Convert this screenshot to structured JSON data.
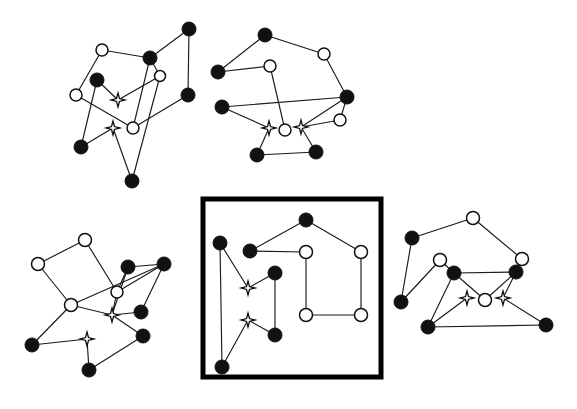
{
  "figure": {
    "background_color": "#ffffff",
    "edge_color": "#1a1a1a",
    "filled_node_color": "#111111",
    "hollow_node_fill": "#ffffff",
    "hollow_node_stroke": "#111111",
    "star_node_fill": "#ffffff",
    "star_node_stroke": "#111111",
    "panel_border_color": "#000000",
    "width": 577,
    "height": 409
  },
  "chart_data": {
    "type": "scatter",
    "xlabel": "",
    "ylabel": "",
    "grid": false,
    "legend": "none",
    "node_types": [
      "filled-circle",
      "hollow-circle",
      "four-point-star"
    ],
    "panels": [
      {
        "id": "panel-top-left",
        "label": "top-left graph",
        "boxed": false,
        "nodes": [
          {
            "id": "A0",
            "type": "hollow-circle",
            "x": 102,
            "y": 50,
            "r": 6
          },
          {
            "id": "A1",
            "type": "filled-circle",
            "x": 150,
            "y": 58,
            "r": 7
          },
          {
            "id": "A2",
            "type": "filled-circle",
            "x": 189,
            "y": 29,
            "r": 7
          },
          {
            "id": "A3",
            "type": "hollow-circle",
            "x": 160,
            "y": 76,
            "r": 5.5
          },
          {
            "id": "A4",
            "type": "filled-circle",
            "x": 97,
            "y": 80,
            "r": 7
          },
          {
            "id": "A5",
            "type": "hollow-circle",
            "x": 76,
            "y": 95,
            "r": 6
          },
          {
            "id": "A6",
            "type": "four-point-star",
            "x": 118,
            "y": 100,
            "r": 7
          },
          {
            "id": "A7",
            "type": "filled-circle",
            "x": 188,
            "y": 95,
            "r": 7
          },
          {
            "id": "A8",
            "type": "hollow-circle",
            "x": 133,
            "y": 128,
            "r": 6
          },
          {
            "id": "A9",
            "type": "four-point-star",
            "x": 113,
            "y": 128,
            "r": 7
          },
          {
            "id": "A10",
            "type": "filled-circle",
            "x": 81,
            "y": 147,
            "r": 7
          },
          {
            "id": "A11",
            "type": "filled-circle",
            "x": 132,
            "y": 181,
            "r": 7
          }
        ],
        "edges": [
          [
            "A0",
            "A1"
          ],
          [
            "A0",
            "A5"
          ],
          [
            "A1",
            "A2"
          ],
          [
            "A1",
            "A3"
          ],
          [
            "A2",
            "A7"
          ],
          [
            "A3",
            "A6"
          ],
          [
            "A4",
            "A6"
          ],
          [
            "A4",
            "A10"
          ],
          [
            "A5",
            "A8"
          ],
          [
            "A7",
            "A8"
          ],
          [
            "A8",
            "A1"
          ],
          [
            "A9",
            "A10"
          ],
          [
            "A9",
            "A11"
          ],
          [
            "A11",
            "A3"
          ]
        ]
      },
      {
        "id": "panel-top-right",
        "label": "top-right graph",
        "boxed": false,
        "nodes": [
          {
            "id": "B0",
            "type": "filled-circle",
            "x": 265,
            "y": 35,
            "r": 7
          },
          {
            "id": "B1",
            "type": "hollow-circle",
            "x": 324,
            "y": 54,
            "r": 6
          },
          {
            "id": "B2",
            "type": "filled-circle",
            "x": 218,
            "y": 72,
            "r": 7
          },
          {
            "id": "B3",
            "type": "hollow-circle",
            "x": 270,
            "y": 66,
            "r": 6
          },
          {
            "id": "B4",
            "type": "filled-circle",
            "x": 347,
            "y": 97,
            "r": 7
          },
          {
            "id": "B5",
            "type": "filled-circle",
            "x": 222,
            "y": 107,
            "r": 7
          },
          {
            "id": "B6",
            "type": "hollow-circle",
            "x": 340,
            "y": 120,
            "r": 6
          },
          {
            "id": "B7",
            "type": "four-point-star",
            "x": 269,
            "y": 128,
            "r": 7
          },
          {
            "id": "B8",
            "type": "hollow-circle",
            "x": 285,
            "y": 130,
            "r": 6
          },
          {
            "id": "B9",
            "type": "four-point-star",
            "x": 301,
            "y": 127,
            "r": 7
          },
          {
            "id": "B10",
            "type": "filled-circle",
            "x": 257,
            "y": 155,
            "r": 7
          },
          {
            "id": "B11",
            "type": "filled-circle",
            "x": 316,
            "y": 152,
            "r": 7
          }
        ],
        "edges": [
          [
            "B0",
            "B1"
          ],
          [
            "B0",
            "B2"
          ],
          [
            "B1",
            "B4"
          ],
          [
            "B2",
            "B3"
          ],
          [
            "B3",
            "B8"
          ],
          [
            "B4",
            "B6"
          ],
          [
            "B4",
            "B5"
          ],
          [
            "B5",
            "B7"
          ],
          [
            "B6",
            "B9"
          ],
          [
            "B7",
            "B10"
          ],
          [
            "B9",
            "B11"
          ],
          [
            "B10",
            "B11"
          ],
          [
            "B9",
            "B4"
          ]
        ]
      },
      {
        "id": "panel-bottom-left",
        "label": "bottom-left graph",
        "boxed": false,
        "nodes": [
          {
            "id": "C0",
            "type": "hollow-circle",
            "x": 85,
            "y": 240,
            "r": 6.5
          },
          {
            "id": "C1",
            "type": "hollow-circle",
            "x": 38,
            "y": 264,
            "r": 6.5
          },
          {
            "id": "C2",
            "type": "filled-circle",
            "x": 128,
            "y": 267,
            "r": 7
          },
          {
            "id": "C3",
            "type": "filled-circle",
            "x": 164,
            "y": 264,
            "r": 7
          },
          {
            "id": "C4",
            "type": "hollow-circle",
            "x": 117,
            "y": 292,
            "r": 6
          },
          {
            "id": "C5",
            "type": "hollow-circle",
            "x": 71,
            "y": 305,
            "r": 6.5
          },
          {
            "id": "C6",
            "type": "four-point-star",
            "x": 112,
            "y": 315,
            "r": 7
          },
          {
            "id": "C7",
            "type": "filled-circle",
            "x": 141,
            "y": 312,
            "r": 7
          },
          {
            "id": "C8",
            "type": "filled-circle",
            "x": 143,
            "y": 336,
            "r": 7
          },
          {
            "id": "C9",
            "type": "four-point-star",
            "x": 87,
            "y": 339,
            "r": 7
          },
          {
            "id": "C10",
            "type": "filled-circle",
            "x": 32,
            "y": 345,
            "r": 7
          },
          {
            "id": "C11",
            "type": "filled-circle",
            "x": 89,
            "y": 370,
            "r": 7
          }
        ],
        "edges": [
          [
            "C0",
            "C1"
          ],
          [
            "C0",
            "C4"
          ],
          [
            "C1",
            "C5"
          ],
          [
            "C2",
            "C4"
          ],
          [
            "C2",
            "C6"
          ],
          [
            "C3",
            "C2"
          ],
          [
            "C3",
            "C7"
          ],
          [
            "C3",
            "C4"
          ],
          [
            "C4",
            "C6"
          ],
          [
            "C5",
            "C6"
          ],
          [
            "C5",
            "C10"
          ],
          [
            "C6",
            "C7"
          ],
          [
            "C6",
            "C8"
          ],
          [
            "C8",
            "C11"
          ],
          [
            "C9",
            "C10"
          ],
          [
            "C9",
            "C11"
          ],
          [
            "C5",
            "C3"
          ]
        ]
      },
      {
        "id": "panel-center-boxed",
        "label": "center boxed graph",
        "boxed": true,
        "box": {
          "x": 203,
          "y": 199,
          "width": 178,
          "height": 178
        },
        "nodes": [
          {
            "id": "D0",
            "type": "filled-circle",
            "x": 220,
            "y": 243,
            "r": 7
          },
          {
            "id": "D1",
            "type": "filled-circle",
            "x": 250,
            "y": 251,
            "r": 7
          },
          {
            "id": "D2",
            "type": "filled-circle",
            "x": 306,
            "y": 220,
            "r": 7
          },
          {
            "id": "D3",
            "type": "hollow-circle",
            "x": 306,
            "y": 252,
            "r": 6.5
          },
          {
            "id": "D4",
            "type": "hollow-circle",
            "x": 361,
            "y": 252,
            "r": 6.5
          },
          {
            "id": "D5",
            "type": "four-point-star",
            "x": 248,
            "y": 288,
            "r": 7
          },
          {
            "id": "D6",
            "type": "filled-circle",
            "x": 275,
            "y": 273,
            "r": 7
          },
          {
            "id": "D7",
            "type": "hollow-circle",
            "x": 306,
            "y": 315,
            "r": 6.5
          },
          {
            "id": "D8",
            "type": "hollow-circle",
            "x": 361,
            "y": 315,
            "r": 6.5
          },
          {
            "id": "D9",
            "type": "four-point-star",
            "x": 248,
            "y": 320,
            "r": 7
          },
          {
            "id": "D10",
            "type": "filled-circle",
            "x": 275,
            "y": 335,
            "r": 7
          },
          {
            "id": "D11",
            "type": "filled-circle",
            "x": 222,
            "y": 367,
            "r": 7
          }
        ],
        "edges": [
          [
            "D0",
            "D5"
          ],
          [
            "D0",
            "D11"
          ],
          [
            "D1",
            "D2"
          ],
          [
            "D1",
            "D3"
          ],
          [
            "D2",
            "D4"
          ],
          [
            "D3",
            "D7"
          ],
          [
            "D4",
            "D8"
          ],
          [
            "D5",
            "D6"
          ],
          [
            "D6",
            "D10"
          ],
          [
            "D7",
            "D8"
          ],
          [
            "D9",
            "D10"
          ],
          [
            "D9",
            "D11"
          ]
        ]
      },
      {
        "id": "panel-bottom-right",
        "label": "bottom-right graph",
        "boxed": false,
        "nodes": [
          {
            "id": "E0",
            "type": "hollow-circle",
            "x": 473,
            "y": 218,
            "r": 6.5
          },
          {
            "id": "E1",
            "type": "filled-circle",
            "x": 412,
            "y": 238,
            "r": 7
          },
          {
            "id": "E2",
            "type": "hollow-circle",
            "x": 440,
            "y": 260,
            "r": 6.5
          },
          {
            "id": "E3",
            "type": "hollow-circle",
            "x": 522,
            "y": 259,
            "r": 6.5
          },
          {
            "id": "E4",
            "type": "filled-circle",
            "x": 454,
            "y": 273,
            "r": 7
          },
          {
            "id": "E5",
            "type": "filled-circle",
            "x": 516,
            "y": 272,
            "r": 7
          },
          {
            "id": "E6",
            "type": "filled-circle",
            "x": 401,
            "y": 302,
            "r": 7
          },
          {
            "id": "E7",
            "type": "four-point-star",
            "x": 467,
            "y": 298,
            "r": 7
          },
          {
            "id": "E8",
            "type": "hollow-circle",
            "x": 485,
            "y": 300,
            "r": 6.5
          },
          {
            "id": "E9",
            "type": "four-point-star",
            "x": 503,
            "y": 298,
            "r": 7
          },
          {
            "id": "E10",
            "type": "filled-circle",
            "x": 428,
            "y": 327,
            "r": 7
          },
          {
            "id": "E11",
            "type": "filled-circle",
            "x": 546,
            "y": 325,
            "r": 7
          }
        ],
        "edges": [
          [
            "E0",
            "E1"
          ],
          [
            "E0",
            "E3"
          ],
          [
            "E1",
            "E6"
          ],
          [
            "E2",
            "E4"
          ],
          [
            "E2",
            "E6"
          ],
          [
            "E3",
            "E5"
          ],
          [
            "E4",
            "E5"
          ],
          [
            "E4",
            "E8"
          ],
          [
            "E4",
            "E10"
          ],
          [
            "E5",
            "E8"
          ],
          [
            "E7",
            "E10"
          ],
          [
            "E9",
            "E11"
          ],
          [
            "E10",
            "E11"
          ],
          [
            "E5",
            "E9"
          ]
        ]
      }
    ]
  }
}
